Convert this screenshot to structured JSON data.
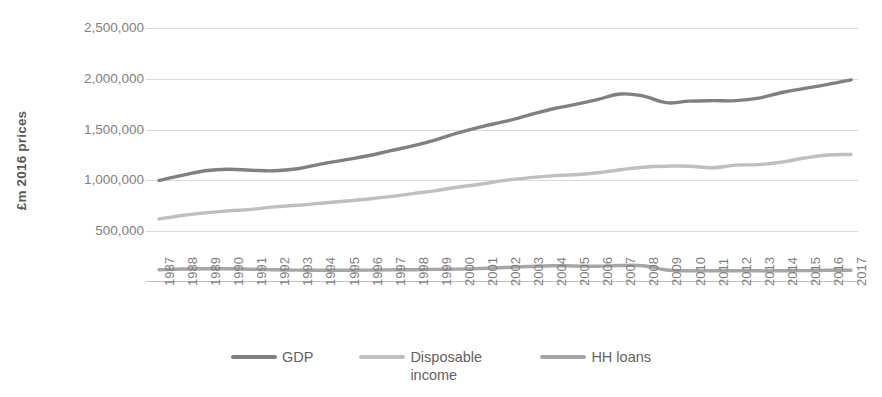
{
  "chart_data": {
    "type": "line",
    "title": "",
    "xlabel": "",
    "ylabel": "£m 2016 prices",
    "ylim": [
      0,
      2500000
    ],
    "ytick_labels": [
      "2,500,000",
      "2,000,000",
      "1,500,000",
      "1,000,000",
      "500,000"
    ],
    "yticks": [
      2500000,
      2000000,
      1500000,
      1000000,
      500000
    ],
    "grid": true,
    "legend_position": "bottom",
    "categories": [
      "1987",
      "1988",
      "1989",
      "1990",
      "1991",
      "1992",
      "1993",
      "1994",
      "1995",
      "1996",
      "1997",
      "1998",
      "1999",
      "2000",
      "2001",
      "2002",
      "2003",
      "2004",
      "2005",
      "2006",
      "2007",
      "2008",
      "2009",
      "2010",
      "2011",
      "2012",
      "2013",
      "2014",
      "2015",
      "2016",
      "2017"
    ],
    "series": [
      {
        "name": "GDP",
        "color": "#808080",
        "values": [
          1000000,
          1050000,
          1095000,
          1110000,
          1100000,
          1095000,
          1115000,
          1160000,
          1200000,
          1240000,
          1290000,
          1340000,
          1400000,
          1470000,
          1530000,
          1580000,
          1640000,
          1700000,
          1745000,
          1795000,
          1850000,
          1830000,
          1765000,
          1780000,
          1785000,
          1785000,
          1810000,
          1865000,
          1905000,
          1945000,
          1990000
        ]
      },
      {
        "name": "Disposable income",
        "color": "#bfbfbf",
        "values": [
          620000,
          655000,
          680000,
          700000,
          715000,
          740000,
          755000,
          775000,
          795000,
          815000,
          840000,
          870000,
          900000,
          935000,
          965000,
          1000000,
          1025000,
          1045000,
          1055000,
          1075000,
          1105000,
          1130000,
          1140000,
          1140000,
          1125000,
          1150000,
          1155000,
          1180000,
          1220000,
          1250000,
          1255000
        ]
      },
      {
        "name": "HH loans",
        "color": "#a6a6a6",
        "values": [
          120000,
          128000,
          131000,
          130000,
          126000,
          120000,
          117000,
          116000,
          116000,
          117000,
          119000,
          121000,
          124000,
          127000,
          133000,
          142000,
          152000,
          160000,
          158000,
          155000,
          162000,
          160000,
          118000,
          110000,
          110000,
          110000,
          110000,
          110000,
          112000,
          115000,
          116000
        ]
      }
    ]
  },
  "legend": {
    "items": [
      {
        "label": "GDP",
        "color": "#808080",
        "wrap": false
      },
      {
        "label": "Disposable income",
        "color": "#bfbfbf",
        "wrap": true
      },
      {
        "label": "HH loans",
        "color": "#a6a6a6",
        "wrap": false
      }
    ]
  }
}
